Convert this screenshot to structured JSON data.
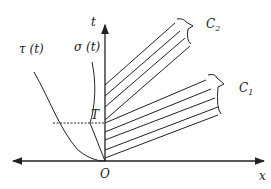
{
  "labels": {
    "t_axis": "t",
    "x_axis": "x",
    "origin": "O",
    "T": "T",
    "tau": "τ (t)",
    "sigma": "σ (t)",
    "C1": "C",
    "C1_sub": "1",
    "C2": "C",
    "C2_sub": "2"
  },
  "colors": {
    "stroke": "#222222"
  }
}
